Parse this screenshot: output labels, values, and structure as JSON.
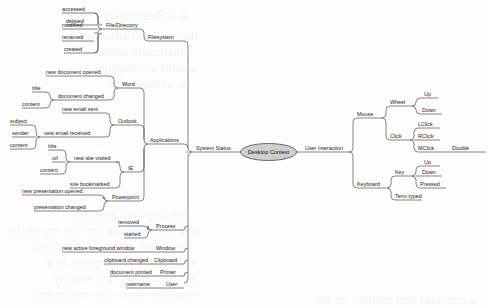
{
  "diagram": {
    "title": "Desktop Context",
    "type": "mind-map",
    "root": {
      "label": "Desktop Context",
      "shape": "ellipse",
      "fill": "#cfcfcf",
      "stroke": "#2f2f2f"
    },
    "line_color": "#3a3a3a",
    "text_color": "#1b1b1b",
    "background": "#fdfdfd"
  },
  "branches": {
    "system_status": {
      "label": "System Status",
      "children": {
        "filesystem": {
          "label": "Filesystem",
          "children": {
            "file_directory": {
              "label": "File/Directory",
              "leaves": [
                "accessed",
                "deleted",
                "modified",
                "renamed",
                "created"
              ]
            }
          }
        },
        "applications": {
          "label": "Applications",
          "children": {
            "word": {
              "label": "Word",
              "events": [
                {
                  "label": "new document opened",
                  "attrs": []
                },
                {
                  "label": "document changed",
                  "attrs": [
                    "title",
                    "content"
                  ]
                }
              ]
            },
            "outlook": {
              "label": "Outlook",
              "events": [
                {
                  "label": "new email sent",
                  "attrs": []
                },
                {
                  "label": "new email received",
                  "attrs": [
                    "subject",
                    "sender",
                    "content"
                  ]
                }
              ]
            },
            "ie": {
              "label": "IE",
              "events": [
                {
                  "label": "new site visited",
                  "attrs": [
                    "title",
                    "url",
                    "content"
                  ]
                },
                {
                  "label": "site bookmarked",
                  "attrs": []
                }
              ]
            },
            "powerpoint": {
              "label": "Powerpoint",
              "events": [
                {
                  "label": "new presentation opened",
                  "attrs": []
                },
                {
                  "label": "presentation changed",
                  "attrs": []
                }
              ]
            }
          }
        },
        "process": {
          "label": "Process",
          "leaves": [
            "removed",
            "started"
          ]
        },
        "window": {
          "label": "Window",
          "leaves": [
            "new active foreground window"
          ]
        },
        "clipboard": {
          "label": "Clipboard",
          "leaves": [
            "clipboard changed"
          ]
        },
        "printer": {
          "label": "Printer",
          "leaves": [
            "document printed"
          ]
        },
        "user": {
          "label": "User",
          "leaves": [
            "username"
          ]
        }
      }
    },
    "user_interaction": {
      "label": "User Interaction",
      "children": {
        "mouse": {
          "label": "Mouse",
          "groups": [
            {
              "label": "Wheel",
              "leaves": [
                "Up",
                "Down"
              ]
            },
            {
              "label": "Click",
              "leaves": [
                "LClick",
                "RClick",
                "MClick"
              ],
              "extra": "Double"
            }
          ]
        },
        "keyboard": {
          "label": "Keyboard",
          "groups": [
            {
              "label": "Key",
              "leaves": [
                "Up",
                "Down",
                "Pressed"
              ]
            }
          ],
          "leaves": [
            "Term typed"
          ]
        }
      }
    }
  },
  "labels": {
    "root": "Desktop Context",
    "system_status": "System Status",
    "user_interaction": "User Interaction",
    "filesystem": "Filesystem",
    "file_directory": "File/Directory",
    "fs_accessed": "accessed",
    "fs_deleted": "deleted",
    "fs_modified": "modified",
    "fs_renamed": "renamed",
    "fs_created": "created",
    "applications": "Applications",
    "word": "Word",
    "word_e1": "new document opened",
    "word_e2": "document changed",
    "word_a1": "title",
    "word_a2": "content",
    "outlook": "Outlook",
    "outlook_e1": "new email sent",
    "outlook_e2": "new email received",
    "outlook_a1": "subject",
    "outlook_a2": "sender",
    "outlook_a3": "content",
    "ie": "IE",
    "ie_e1": "new site visited",
    "ie_e2": "site bookmarked",
    "ie_a1": "title",
    "ie_a2": "url",
    "ie_a3": "content",
    "powerpoint": "Powerpoint",
    "ppt_e1": "new presentation opened",
    "ppt_e2": "presentation changed",
    "process": "Process",
    "proc_e1": "removed",
    "proc_e2": "started",
    "window": "Window",
    "win_e1": "new active foreground window",
    "clipboard": "Clipboard",
    "clip_e1": "clipboard changed",
    "printer": "Printer",
    "print_e1": "document printed",
    "user": "User",
    "user_e1": "username",
    "mouse": "Mouse",
    "wheel": "Wheel",
    "wheel_up": "Up",
    "wheel_down": "Down",
    "click": "Click",
    "lclick": "LClick",
    "rclick": "RClick",
    "mclick": "MClick",
    "double": "Double",
    "keyboard": "Keyboard",
    "key": "Key",
    "key_up": "Up",
    "key_down": "Down",
    "key_pressed": "Pressed",
    "term_typed": "Term typed"
  },
  "background_bleed": {
    "note": "faint mirrored show-through text from reverse of scanned page",
    "lines": [
      "4.2 Regularity",
      "theory. We following",
      "constraints when",
      "a mild assumption to",
      "is, at most, the",
      "sex requires possible",
      "and dramatically the site on which",
      "the stores authors subjecting",
      "with a low assumption in a",
      "a for the data. It is readily",
      "can therefore class estimated",
      "a constant and matters on the"
    ]
  }
}
